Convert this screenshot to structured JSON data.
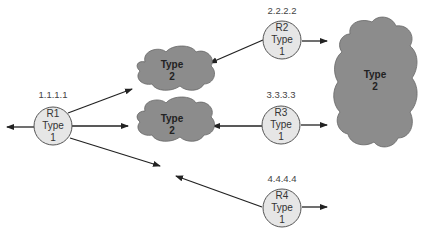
{
  "diagram": {
    "colors": {
      "router_fill": "#e6e6e6",
      "router_stroke": "#555555",
      "cloud_fill": "#8c8c8c",
      "cloud_stroke": "#666666",
      "arrow": "#222222"
    },
    "routers": [
      {
        "id": "R1",
        "ip": "1.1.1.1",
        "name": "R1",
        "line2": "Type",
        "line3": "1"
      },
      {
        "id": "R2",
        "ip": "2.2.2.2",
        "name": "R2",
        "line2": "Type",
        "line3": "1"
      },
      {
        "id": "R3",
        "ip": "3.3.3.3",
        "name": "R3",
        "line2": "Type",
        "line3": "1"
      },
      {
        "id": "R4",
        "ip": "4.4.4.4",
        "name": "R4",
        "line2": "Type",
        "line3": "1"
      }
    ],
    "clouds": [
      {
        "id": "cloud-top",
        "line1": "Type",
        "line2": "2"
      },
      {
        "id": "cloud-middle",
        "line1": "Type",
        "line2": "2"
      },
      {
        "id": "cloud-large",
        "line1": "Type",
        "line2": "2"
      }
    ]
  }
}
